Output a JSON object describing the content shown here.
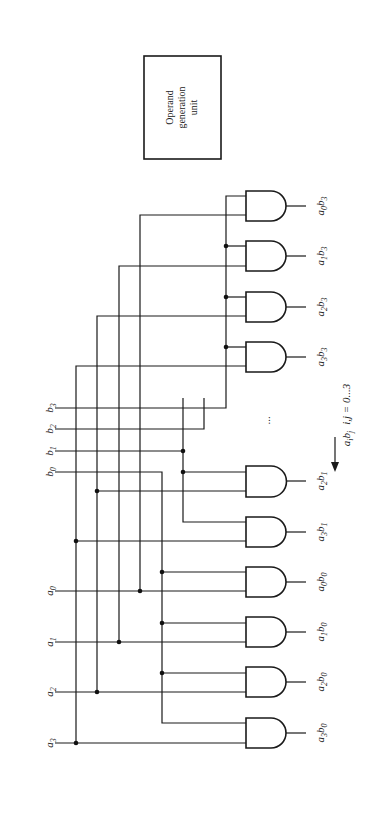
{
  "diagram": {
    "box": {
      "lines": [
        "Operand",
        "generation",
        "unit"
      ]
    },
    "inputs": {
      "b": [
        {
          "name": "b",
          "sub": "3",
          "y": 408
        },
        {
          "name": "b",
          "sub": "2",
          "y": 429
        },
        {
          "name": "b",
          "sub": "1",
          "y": 451
        },
        {
          "name": "b",
          "sub": "0",
          "y": 472
        }
      ],
      "a": [
        {
          "name": "a",
          "sub": "0",
          "y": 591
        },
        {
          "name": "a",
          "sub": "1",
          "y": 642
        },
        {
          "name": "a",
          "sub": "2",
          "y": 692
        },
        {
          "name": "a",
          "sub": "3",
          "y": 743
        }
      ]
    },
    "gates": [
      {
        "label_a": "a",
        "sub_a": "0",
        "label_b": "b",
        "sub_b": "3",
        "top": 191
      },
      {
        "label_a": "a",
        "sub_a": "1",
        "label_b": "b",
        "sub_b": "3",
        "top": 241
      },
      {
        "label_a": "a",
        "sub_a": "2",
        "label_b": "b",
        "sub_b": "3",
        "top": 292
      },
      {
        "label_a": "a",
        "sub_a": "3",
        "label_b": "b",
        "sub_b": "3",
        "top": 342
      },
      {
        "label_a": "a",
        "sub_a": "2",
        "label_b": "b",
        "sub_b": "1",
        "top": 466
      },
      {
        "label_a": "a",
        "sub_a": "3",
        "label_b": "b",
        "sub_b": "1",
        "top": 517
      },
      {
        "label_a": "a",
        "sub_a": "0",
        "label_b": "b",
        "sub_b": "0",
        "top": 567
      },
      {
        "label_a": "a",
        "sub_a": "1",
        "label_b": "b",
        "sub_b": "0",
        "top": 617
      },
      {
        "label_a": "a",
        "sub_a": "2",
        "label_b": "b",
        "sub_b": "0",
        "top": 667
      },
      {
        "label_a": "a",
        "sub_a": "3",
        "label_b": "b",
        "sub_b": "0",
        "top": 718
      }
    ],
    "ellipsis": "...",
    "annotation": {
      "product": "a",
      "product_sub_i": "i",
      "product_b": "b",
      "product_sub_j": "j",
      "range": "i,j = 0...3"
    },
    "colors": {
      "ink": "#1a1a1a",
      "background": "#ffffff"
    }
  }
}
